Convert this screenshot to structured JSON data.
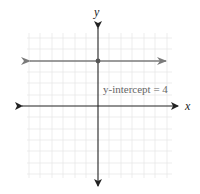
{
  "diagram": {
    "type": "coordinate-plane",
    "x_axis_label": "x",
    "y_axis_label": "y",
    "annotation": "y-intercept = 4",
    "line": {
      "equation": "y = 4",
      "slope": 0,
      "y_intercept": 4
    },
    "point": {
      "x": 0,
      "y": 4
    },
    "grid_range": {
      "x": [
        -6,
        6
      ],
      "y": [
        -6,
        6
      ]
    },
    "colors": {
      "axes": "#222222",
      "line": "#7a7a7a",
      "grid": "#e6e6e6",
      "annotation": "#666666"
    }
  }
}
